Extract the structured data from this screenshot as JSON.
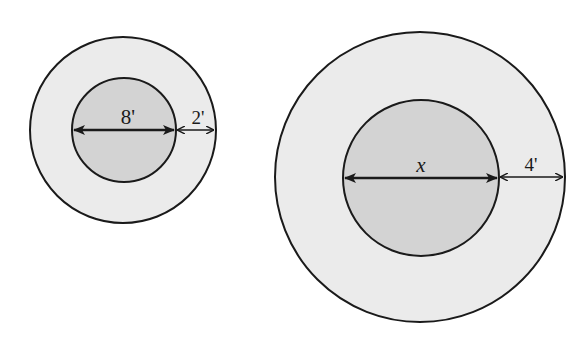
{
  "diagram": {
    "type": "concentric-circles",
    "colors": {
      "background": "#ffffff",
      "outer_ring_fill": "#ebebeb",
      "inner_circle_fill": "#d3d3d3",
      "stroke": "#1a1a1a"
    },
    "figures": [
      {
        "id": "small",
        "center": [
          123,
          130
        ],
        "outer_radius": 93,
        "inner_radius": 52,
        "inner_diameter_label": "8'",
        "ring_width_label": "2'"
      },
      {
        "id": "large",
        "center": [
          420,
          177
        ],
        "outer_radius": 145,
        "inner_radius": 78,
        "inner_diameter_label": "x",
        "ring_width_label": "4'"
      }
    ]
  }
}
